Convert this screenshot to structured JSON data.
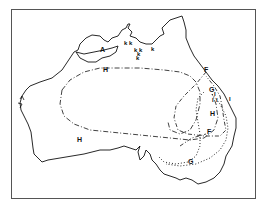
{
  "map": {
    "region": "Australia",
    "style": "black-and-white line map",
    "colors": {
      "ink": "#111111",
      "frame": "#555555",
      "background": "#ffffff"
    },
    "boundary_labels": [
      {
        "id": "A",
        "text": "A",
        "line_style": "solid"
      },
      {
        "id": "H_north",
        "text": "H",
        "line_style": "dash-dot"
      },
      {
        "id": "H_south",
        "text": "H",
        "line_style": "dash-dot"
      },
      {
        "id": "H_east",
        "text": "H",
        "line_style": "dash-dot"
      },
      {
        "id": "F_north",
        "text": "F",
        "line_style": "dash-dot"
      },
      {
        "id": "F_south",
        "text": "F",
        "line_style": "dash-dot"
      },
      {
        "id": "G_north",
        "text": "G",
        "line_style": "dotted"
      },
      {
        "id": "G_south",
        "text": "G",
        "line_style": "dotted"
      }
    ],
    "point_markers": {
      "k": [
        "k",
        "k",
        "k",
        "k",
        "k",
        "k",
        "k"
      ],
      "I": [
        "I",
        "I",
        "I",
        "I"
      ]
    }
  }
}
